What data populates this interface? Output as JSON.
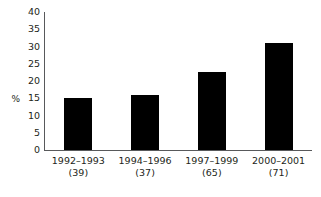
{
  "chart_data": {
    "type": "bar",
    "title": "",
    "subtitle": "",
    "xlabel": "",
    "ylabel": "%",
    "ylim": [
      0,
      40
    ],
    "ytick_values": [
      40,
      35,
      30,
      25,
      20,
      15,
      10,
      5,
      0
    ],
    "ytick_labels": [
      "40",
      "35",
      "30",
      "25",
      "20",
      "15",
      "10",
      "5",
      "0"
    ],
    "grid": false,
    "legend": null,
    "bar_color": "#000000",
    "axis_color": "#58595b",
    "categories": [
      "1992–1993",
      "1994–1996",
      "1997–1999",
      "2000–2001"
    ],
    "category_counts": [
      "(39)",
      "(37)",
      "(65)",
      "(71)"
    ],
    "values": [
      15,
      16,
      22.5,
      31
    ],
    "series": [
      {
        "name": "",
        "values": [
          15,
          16,
          22.5,
          31
        ]
      }
    ]
  }
}
